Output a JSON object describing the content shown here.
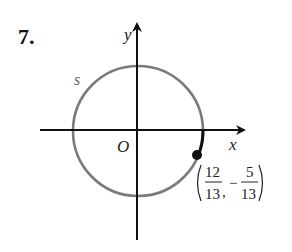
{
  "problem": {
    "number": "7."
  },
  "diagram": {
    "axis_labels": {
      "x": "x",
      "y": "y",
      "origin": "O"
    },
    "arc_label": "s",
    "point": {
      "x_num": "12",
      "x_den": "13",
      "separator": ",",
      "sign": "−",
      "y_num": "5",
      "y_den": "13"
    },
    "colors": {
      "circle": "#7a7a7a",
      "axes": "#111111",
      "arc": "#111111",
      "point": "#111111"
    }
  }
}
